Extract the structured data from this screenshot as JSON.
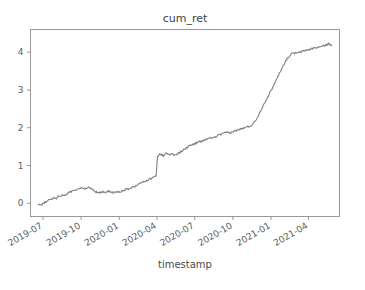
{
  "chart_data": {
    "type": "line",
    "title": "cum_ret",
    "xlabel": "timestamp",
    "ylabel": "",
    "grid": false,
    "legend": null,
    "legend_position": "none",
    "line_color": "#808080",
    "background_color": "#ffffff",
    "axis_color": "#999999",
    "xtick_rotation_deg": -30,
    "xlim": [
      "2019-06-01",
      "2021-06-15"
    ],
    "ylim": [
      -0.35,
      4.6
    ],
    "xticks": [
      "2019-07",
      "2019-10",
      "2020-01",
      "2020-04",
      "2020-07",
      "2020-10",
      "2021-01",
      "2021-04"
    ],
    "yticks": [
      0,
      1,
      2,
      3,
      4
    ],
    "series": [
      {
        "name": "cum_ret",
        "x": [
          "2019-06-20",
          "2019-06-27",
          "2019-07-04",
          "2019-07-11",
          "2019-07-18",
          "2019-07-25",
          "2019-08-01",
          "2019-08-08",
          "2019-08-15",
          "2019-08-22",
          "2019-08-29",
          "2019-09-05",
          "2019-09-12",
          "2019-09-19",
          "2019-09-26",
          "2019-10-03",
          "2019-10-10",
          "2019-10-17",
          "2019-10-24",
          "2019-10-31",
          "2019-11-07",
          "2019-11-14",
          "2019-11-21",
          "2019-11-28",
          "2019-12-05",
          "2019-12-12",
          "2019-12-19",
          "2019-12-26",
          "2020-01-02",
          "2020-01-09",
          "2020-01-16",
          "2020-01-23",
          "2020-01-30",
          "2020-02-06",
          "2020-02-13",
          "2020-02-20",
          "2020-02-27",
          "2020-03-05",
          "2020-03-12",
          "2020-03-19",
          "2020-03-23",
          "2020-03-26",
          "2020-03-28",
          "2020-03-29",
          "2020-03-30",
          "2020-04-02",
          "2020-04-09",
          "2020-04-16",
          "2020-04-23",
          "2020-04-30",
          "2020-05-07",
          "2020-05-14",
          "2020-05-21",
          "2020-05-28",
          "2020-06-04",
          "2020-06-11",
          "2020-06-18",
          "2020-06-25",
          "2020-07-02",
          "2020-07-09",
          "2020-07-16",
          "2020-07-23",
          "2020-07-30",
          "2020-08-06",
          "2020-08-13",
          "2020-08-20",
          "2020-08-27",
          "2020-09-03",
          "2020-09-10",
          "2020-09-17",
          "2020-09-24",
          "2020-10-01",
          "2020-10-08",
          "2020-10-15",
          "2020-10-22",
          "2020-10-29",
          "2020-11-05",
          "2020-11-12",
          "2020-11-19",
          "2020-11-26",
          "2020-12-03",
          "2020-12-10",
          "2020-12-17",
          "2020-12-24",
          "2020-12-31",
          "2021-01-07",
          "2021-01-14",
          "2021-01-21",
          "2021-01-28",
          "2021-02-04",
          "2021-02-11",
          "2021-02-18",
          "2021-02-25",
          "2021-03-04",
          "2021-03-11",
          "2021-03-18",
          "2021-03-25",
          "2021-04-01",
          "2021-04-08",
          "2021-04-15",
          "2021-04-22",
          "2021-04-29",
          "2021-05-06",
          "2021-05-13",
          "2021-05-20",
          "2021-05-27"
        ],
        "y": [
          -0.02,
          -0.05,
          0.02,
          0.06,
          0.1,
          0.13,
          0.12,
          0.18,
          0.22,
          0.2,
          0.26,
          0.3,
          0.34,
          0.33,
          0.38,
          0.4,
          0.39,
          0.42,
          0.41,
          0.33,
          0.3,
          0.28,
          0.31,
          0.29,
          0.32,
          0.3,
          0.27,
          0.31,
          0.29,
          0.33,
          0.36,
          0.38,
          0.41,
          0.44,
          0.47,
          0.52,
          0.56,
          0.6,
          0.63,
          0.66,
          0.69,
          0.71,
          0.72,
          0.73,
          0.72,
          1.25,
          1.3,
          1.26,
          1.33,
          1.28,
          1.3,
          1.27,
          1.31,
          1.36,
          1.41,
          1.46,
          1.52,
          1.56,
          1.58,
          1.62,
          1.63,
          1.67,
          1.7,
          1.72,
          1.74,
          1.76,
          1.8,
          1.83,
          1.85,
          1.88,
          1.86,
          1.9,
          1.92,
          1.95,
          1.97,
          2.0,
          2.02,
          2.05,
          2.1,
          2.22,
          2.36,
          2.52,
          2.68,
          2.82,
          2.96,
          3.12,
          3.28,
          3.44,
          3.6,
          3.74,
          3.86,
          3.94,
          3.98,
          3.97,
          4.0,
          4.02,
          4.05,
          4.06,
          4.09,
          4.11,
          4.12,
          4.14,
          4.16,
          4.19,
          4.22,
          4.17
        ]
      }
    ]
  },
  "figure": {
    "title": "cum_ret",
    "xlabel": "timestamp"
  }
}
